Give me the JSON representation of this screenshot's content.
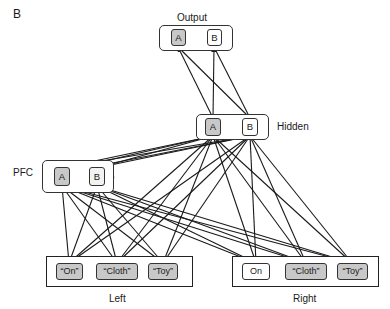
{
  "panel_label": "B",
  "colors": {
    "active_fill": "#c8c8c8",
    "inactive_fill": "#ffffff",
    "line": "#1a1a1a"
  },
  "layers": {
    "output": {
      "label": "Output",
      "nodes": [
        {
          "label": "A",
          "active": true
        },
        {
          "label": "B",
          "active": false
        }
      ]
    },
    "hidden": {
      "label": "Hidden",
      "nodes": [
        {
          "label": "A",
          "active": true
        },
        {
          "label": "B",
          "active": false
        }
      ]
    },
    "pfc": {
      "label": "PFC",
      "nodes": [
        {
          "label": "A",
          "active": true
        },
        {
          "label": "B",
          "active": false
        }
      ],
      "self_recurrent": true
    },
    "left": {
      "label": "Left",
      "nodes": [
        {
          "label": "“On”",
          "active": true
        },
        {
          "label": "“Cloth”",
          "active": true
        },
        {
          "label": "“Toy”",
          "active": true
        }
      ]
    },
    "right": {
      "label": "Right",
      "nodes": [
        {
          "label": "On",
          "active": false
        },
        {
          "label": "“Cloth”",
          "active": true
        },
        {
          "label": "“Toy”",
          "active": true
        }
      ]
    }
  },
  "connections": [
    "hidden -> output (all-to-all)",
    "pfc -> hidden (all-to-all)",
    "left, right -> hidden (all-to-all)",
    "left, right -> pfc (all-to-all)",
    "A <-> B lateral within output, hidden, pfc",
    "pfc self-loops"
  ]
}
